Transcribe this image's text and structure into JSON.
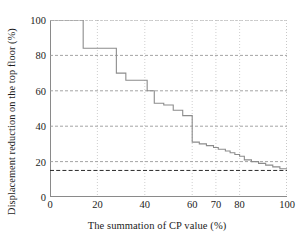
{
  "chart_data": {
    "type": "line",
    "title": "",
    "xlabel": "The summation of CP value (%)",
    "ylabel": "Displacement reduction on the top floor (%)",
    "xlim": [
      0,
      100
    ],
    "ylim": [
      0,
      100
    ],
    "grid": true,
    "grid_style": "dotted",
    "legend": "none",
    "xticks": [
      0,
      20,
      40,
      60,
      70,
      80,
      100
    ],
    "xtick_labels": [
      "0",
      "20",
      "40",
      "60",
      "70",
      "80",
      "100"
    ],
    "yticks": [
      0,
      20,
      40,
      60,
      80,
      100
    ],
    "ytick_labels": [
      "0",
      "20",
      "40",
      "60",
      "80",
      "100"
    ],
    "series": [
      {
        "name": "Displacement reduction",
        "drawstyle": "steps-post",
        "color": "#8c8c8c",
        "x": [
          0,
          14,
          28,
          32,
          41,
          44,
          48,
          52,
          56,
          60,
          63,
          66,
          69,
          71,
          74,
          76,
          78,
          80,
          82,
          85,
          88,
          91,
          94,
          97,
          100
        ],
        "y": [
          100,
          84,
          70,
          66,
          60,
          53,
          52,
          49,
          46,
          31,
          30,
          29,
          28,
          27,
          26,
          25,
          24,
          23,
          21,
          20,
          19,
          18,
          17,
          16,
          15.5
        ]
      }
    ],
    "annotations": [
      {
        "type": "hline",
        "name": "target-reduction-threshold",
        "y": 15,
        "style": "dashed",
        "color": "#2b2b2b",
        "label": ""
      }
    ]
  },
  "axes": {
    "ylabel": "Displacement reduction on the top floor (%)",
    "xlabel": "The summation of CP value (%)"
  }
}
